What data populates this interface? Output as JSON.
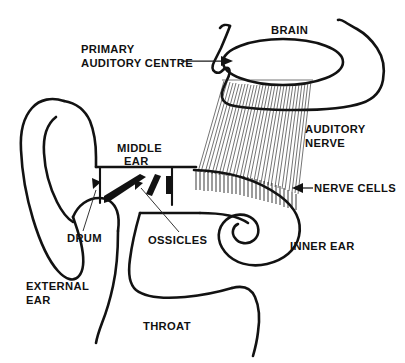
{
  "diagram": {
    "background_color": "#ffffff",
    "ink_color": "#121212",
    "width": 405,
    "height": 363,
    "labels": {
      "brain": "BRAIN",
      "primary_auditory_centre_line1": "PRIMARY",
      "primary_auditory_centre_line2": "AUDITORY CENTRE",
      "auditory_nerve_line1": "AUDITORY",
      "auditory_nerve_line2": "NERVE",
      "nerve_cells": "NERVE CELLS",
      "inner_ear": "INNER EAR",
      "middle_ear_line1": "MIDDLE",
      "middle_ear_line2": "EAR",
      "ossicles": "OSSICLES",
      "drum": "DRUM",
      "external_ear_line1": "EXTERNAL",
      "external_ear_line2": "EAR",
      "throat": "THROAT"
    },
    "parts": [
      {
        "id": "brain",
        "name": "Brain",
        "label": "BRAIN"
      },
      {
        "id": "primary-auditory-centre",
        "name": "Primary auditory centre",
        "label": "PRIMARY AUDITORY CENTRE"
      },
      {
        "id": "auditory-nerve",
        "name": "Auditory nerve",
        "label": "AUDITORY NERVE"
      },
      {
        "id": "nerve-cells",
        "name": "Nerve cells",
        "label": "NERVE CELLS"
      },
      {
        "id": "inner-ear",
        "name": "Inner ear (cochlea)",
        "label": "INNER EAR"
      },
      {
        "id": "middle-ear",
        "name": "Middle ear",
        "label": "MIDDLE EAR"
      },
      {
        "id": "ossicles",
        "name": "Ossicles",
        "label": "OSSICLES"
      },
      {
        "id": "drum",
        "name": "Eardrum",
        "label": "DRUM"
      },
      {
        "id": "external-ear",
        "name": "External ear (pinna)",
        "label": "EXTERNAL EAR"
      },
      {
        "id": "throat",
        "name": "Throat",
        "label": "THROAT"
      }
    ]
  }
}
